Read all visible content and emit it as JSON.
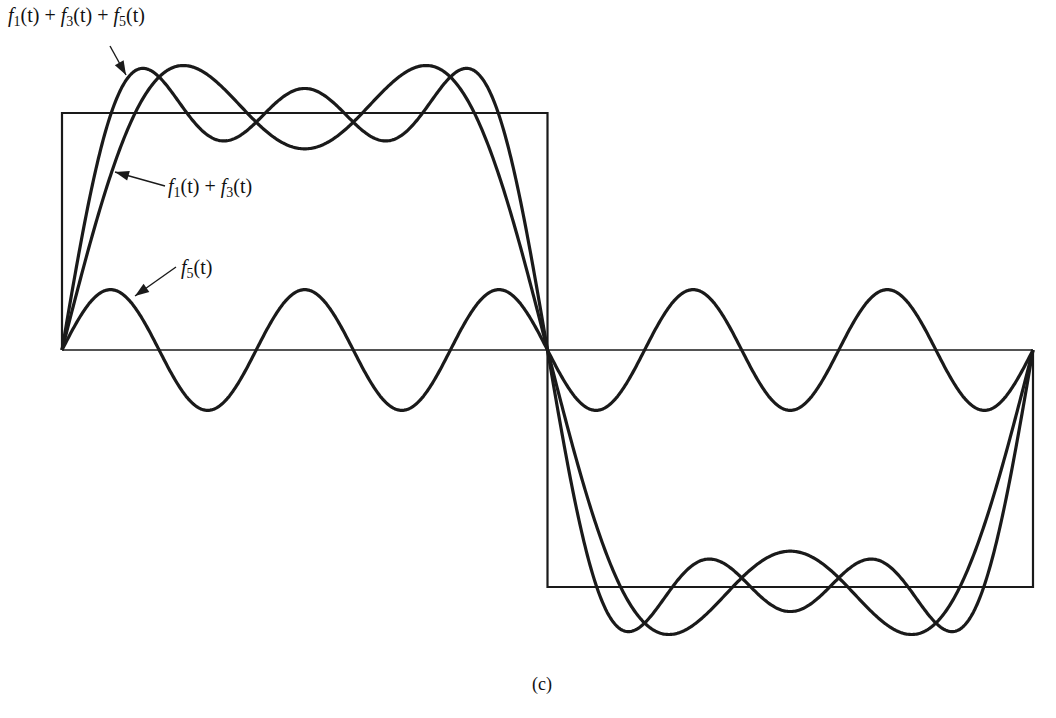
{
  "chart_data": {
    "type": "line",
    "title": "",
    "caption": "(c)",
    "xlabel": "t",
    "ylabel": "",
    "grid": false,
    "legend_position": "annotations",
    "period_fraction_shown": [
      0,
      1
    ],
    "square_wave": {
      "amplitude": 1,
      "high_interval": [
        0,
        0.5
      ],
      "low_interval": [
        0.5,
        1
      ]
    },
    "series": [
      {
        "name": "square wave",
        "formula": "sign(sin(2πt))"
      },
      {
        "name": "f1(t) + f3(t)",
        "formula": "(4/π)[sin(2πt) + sin(6πt)/3]"
      },
      {
        "name": "f1(t) + f3(t) + f5(t)",
        "formula": "(4/π)[sin(2πt) + sin(6πt)/3 + sin(10πt)/5]"
      },
      {
        "name": "f5(t)",
        "formula": "(4/π)·sin(10πt)/5"
      }
    ],
    "annotations": [
      {
        "text": "f1(t) + f3(t) + f5(t)",
        "points_to": "first peak of 3-harmonic sum"
      },
      {
        "text": "f1(t) + f3(t)",
        "points_to": "rising edge of 2-harmonic sum"
      },
      {
        "text": "f5(t)",
        "points_to": "first peak of f5"
      }
    ],
    "ylim": [
      -1.35,
      1.35
    ],
    "xlim": [
      0,
      1
    ]
  },
  "labels": {
    "sum135": {
      "f1": "f",
      "s1": "1",
      "t1": "(t) + ",
      "f3": "f",
      "s3": "3",
      "t3": "(t) + ",
      "f5": "f",
      "s5": "5",
      "t5": "(t)"
    },
    "sum13": {
      "f1": "f",
      "s1": "1",
      "t1": "(t) + ",
      "f3": "f",
      "s3": "3",
      "t3": "(t)"
    },
    "f5": {
      "f": "f",
      "s": "5",
      "t": "(t)"
    },
    "caption": "(c)"
  },
  "geometry": {
    "x0": 62,
    "x1": 1033,
    "baseline": 350,
    "square_height": 237,
    "line_color": "#1a1a1a"
  }
}
